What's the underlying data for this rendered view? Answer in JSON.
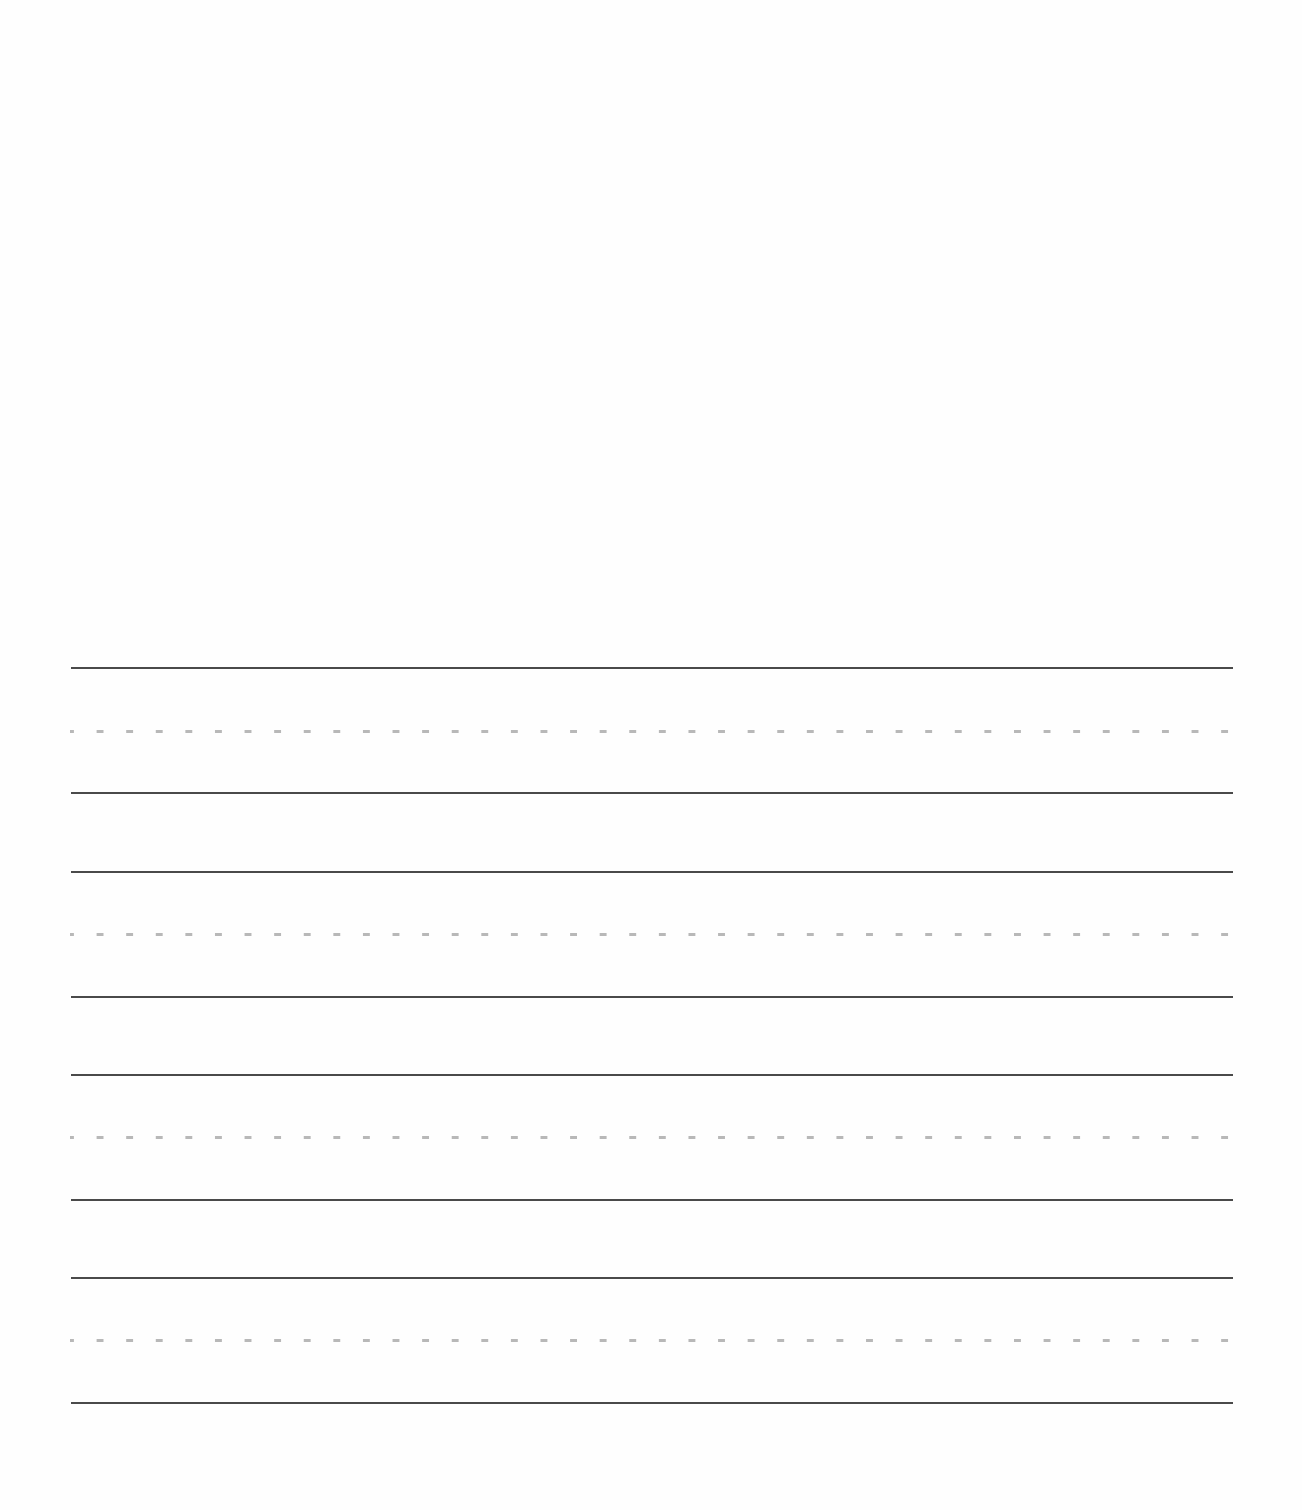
{
  "page": {
    "type": "handwriting-practice-sheet",
    "background_color": "#fefefe",
    "blank_drawing_area": true
  },
  "writing_lines": {
    "line_color": "#4a4a4a",
    "midline_color": "#b8b8b8",
    "x_start": 71,
    "x_end": 1233,
    "sets": [
      {
        "top": 668,
        "midline": 731,
        "baseline": 793
      },
      {
        "top": 872,
        "midline": 934,
        "baseline": 997
      },
      {
        "top": 1075,
        "midline": 1137,
        "baseline": 1200
      },
      {
        "top": 1278,
        "midline": 1340,
        "baseline": 1403
      }
    ]
  }
}
